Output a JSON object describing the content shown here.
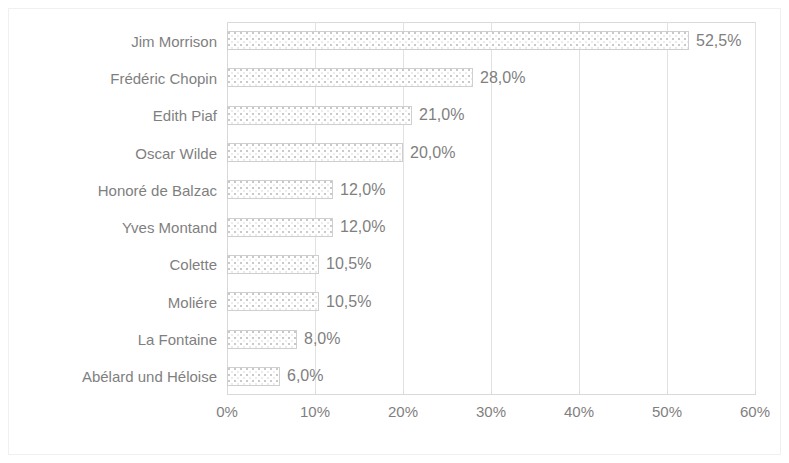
{
  "chart_data": {
    "type": "bar",
    "orientation": "horizontal",
    "title": "",
    "subtitle": "",
    "xlabel": "",
    "ylabel": "",
    "xlim": [
      0,
      60
    ],
    "xtick_step": 10,
    "grid": true,
    "legend": "none",
    "value_label_format": "comma-decimal-percent",
    "categories": [
      "Jim Morrison",
      "Frédéric Chopin",
      "Edith Piaf",
      "Oscar Wilde",
      "Honoré de Balzac",
      "Yves Montand",
      "Colette",
      "Moliére",
      "La Fontaine",
      "Abélard und Héloise"
    ],
    "values": [
      52.5,
      28.0,
      21.0,
      20.0,
      12.0,
      12.0,
      10.5,
      10.5,
      8.0,
      6.0
    ],
    "value_labels": [
      "52,5%",
      "28,0%",
      "21,0%",
      "20,0%",
      "12,0%",
      "12,0%",
      "10,5%",
      "10,5%",
      "8,0%",
      "6,0%"
    ],
    "xtick_labels": [
      "0%",
      "10%",
      "20%",
      "30%",
      "40%",
      "50%",
      "60%"
    ],
    "xtick_values": [
      0,
      10,
      20,
      30,
      40,
      50,
      60
    ],
    "colors": {
      "bar_fill": "#ffffff",
      "bar_pattern_dots": "#c8c8c8",
      "bar_border": "#cfcfcf",
      "text": "#7f7f7f",
      "gridline": "#e2e2e2",
      "axis": "#d9d9d9",
      "frame": "#f0f0f0",
      "background": "#ffffff"
    }
  }
}
